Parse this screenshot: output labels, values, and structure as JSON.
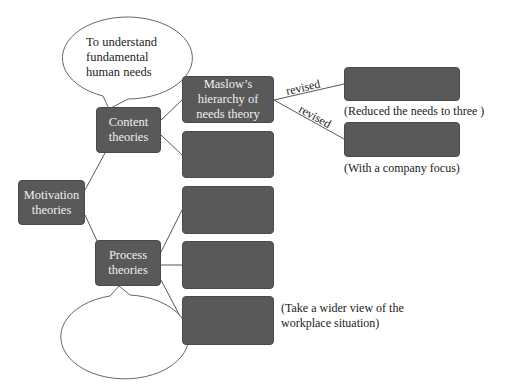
{
  "diagram": {
    "root": {
      "label": "Motivation theories"
    },
    "content": {
      "label": "Content theories",
      "bubble": "To understand fundamental human needs",
      "children": [
        {
          "label": "Maslow’s hierarchy of needs theory"
        },
        {
          "label": ""
        }
      ],
      "maslow_revisions": [
        {
          "edge_label": "revised",
          "box_label": "",
          "note": "(Reduced the needs to three )"
        },
        {
          "edge_label": "revised",
          "box_label": "",
          "note": "(With a company focus)"
        }
      ]
    },
    "process": {
      "label": "Process theories",
      "bubble": "",
      "children": [
        {
          "label": "",
          "note": ""
        },
        {
          "label": "",
          "note": ""
        },
        {
          "label": "",
          "note": "(Take a wider view of the workplace situation)"
        }
      ]
    }
  },
  "colors": {
    "box_fill": "#595959",
    "box_text": "#f0f0f0",
    "line": "#444444"
  }
}
